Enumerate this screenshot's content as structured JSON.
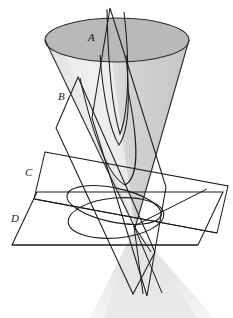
{
  "figure": {
    "background_color": "#ffffff",
    "stroke_color": "#1a1a1a",
    "width": 233,
    "height": 318
  },
  "cone": {
    "name": "double-cone",
    "apex": {
      "x": 135,
      "y": 228
    },
    "upper_nappe": {
      "rim_center": {
        "x": 117,
        "y": 40
      },
      "rim_rx": 72,
      "rim_ry": 22,
      "interior_fill": "#b9b9b9",
      "body_fill": "#cfcfcf",
      "highlight_fill": "#e8e8e8"
    },
    "lower_nappe": {
      "rim_center": {
        "x": 152,
        "y": 316
      },
      "rim_rx": 62,
      "rim_ry": 18,
      "body_fill": "#efefef"
    }
  },
  "planes": [
    {
      "id": "A",
      "label": "A",
      "label_pos": {
        "x": 88,
        "y": 41
      },
      "conic": "ellipse",
      "description": "plane cutting the upper nappe obliquely"
    },
    {
      "id": "B",
      "label": "B",
      "label_pos": {
        "x": 62,
        "y": 97
      },
      "conic": "parabola",
      "description": "plane parallel to a generator of the cone"
    },
    {
      "id": "C",
      "label": "C",
      "label_pos": {
        "x": 29,
        "y": 172
      },
      "conic": "ellipse",
      "description": "tilted plane cutting one nappe"
    },
    {
      "id": "D",
      "label": "D",
      "label_pos": {
        "x": 15,
        "y": 219
      },
      "conic": "circle",
      "description": "horizontal plane perpendicular to the axis"
    }
  ],
  "curves": [
    {
      "name": "circle-section-D",
      "conic": "circle"
    },
    {
      "name": "ellipse-section-C",
      "conic": "ellipse"
    },
    {
      "name": "parabola-section-B",
      "conic": "parabola"
    },
    {
      "name": "hyperbola-section-A",
      "conic": "hyperbola"
    }
  ]
}
